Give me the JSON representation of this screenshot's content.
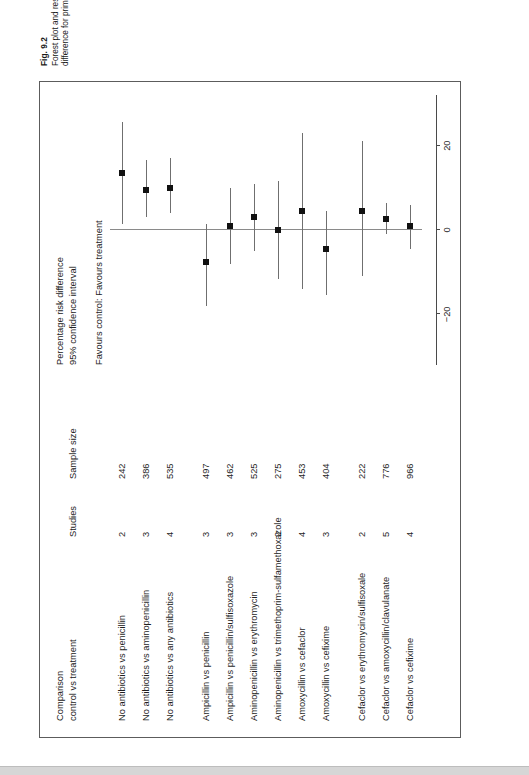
{
  "figure": {
    "number": "Fig. 9.2",
    "caption": "Forest plot and results from Rosenfeld's review for the main outcome of primary symptom control. Percentage risk difference for primary control of otitis media."
  },
  "headers": {
    "comparison": "Comparison\ncontrol vs treatment",
    "comparison_line1": "Comparison",
    "comparison_line2": "control vs treatment",
    "studies": "Studies",
    "sample_size": "Sample size",
    "axis_title_line1": "Percentage risk difference",
    "axis_title_line2": "95% confidence interval",
    "favours": "Favours control: Favours treatment"
  },
  "axis": {
    "ticks": [
      -20,
      0,
      20
    ],
    "tick_labels": [
      "−20",
      "0",
      "20"
    ],
    "min": -32,
    "max": 32
  },
  "chart_data": {
    "type": "forest",
    "title": "Percentage risk difference 95% confidence interval",
    "xlabel": "Percentage risk difference",
    "ylabel": "",
    "xlim": [
      -32,
      32
    ],
    "grid": false,
    "legend": "none",
    "zero_line": 0,
    "columns": [
      "Comparison control vs treatment",
      "Studies",
      "Sample size"
    ],
    "rows": [
      {
        "label": "No antibiotics vs penicillin",
        "studies": "2",
        "sample": "242",
        "estimate": 13.5,
        "lower": 1.5,
        "upper": 25.5,
        "group": 1
      },
      {
        "label": "No antibiotics vs aminopenicillin",
        "studies": "3",
        "sample": "386",
        "estimate": 9.5,
        "lower": 3.0,
        "upper": 16.5,
        "group": 1
      },
      {
        "label": "No antibiotics vs any antibiotics",
        "studies": "4",
        "sample": "535",
        "estimate": 10.0,
        "lower": 4.0,
        "upper": 17.0,
        "group": 1
      },
      {
        "label": "Ampicillin vs penicillin",
        "studies": "3",
        "sample": "497",
        "estimate": -7.5,
        "lower": -18.0,
        "upper": 1.5,
        "group": 2
      },
      {
        "label": "Ampicillin vs penicillin/sulfisoxazole",
        "studies": "3",
        "sample": "462",
        "estimate": 1.0,
        "lower": -8.0,
        "upper": 10.0,
        "group": 2
      },
      {
        "label": "Aminopenicillin vs erythromycin",
        "studies": "3",
        "sample": "525",
        "estimate": 3.0,
        "lower": -5.0,
        "upper": 11.0,
        "group": 2
      },
      {
        "label": "Aminopenicillin vs trimethoprim-sulfamethoxazole",
        "studies": "2",
        "sample": "275",
        "estimate": 0.0,
        "lower": -11.5,
        "upper": 11.5,
        "group": 2
      },
      {
        "label": "Amoxycillin vs cefaclor",
        "studies": "4",
        "sample": "453",
        "estimate": 4.5,
        "lower": -14.0,
        "upper": 23.0,
        "group": 2
      },
      {
        "label": "Amoxycillin vs cefixime",
        "studies": "3",
        "sample": "404",
        "estimate": -4.5,
        "lower": -15.5,
        "upper": 4.5,
        "group": 2
      },
      {
        "label": "Cefaclor vs erythromycin/sulfisoxale",
        "studies": "2",
        "sample": "222",
        "estimate": 4.5,
        "lower": -11.0,
        "upper": 21.0,
        "group": 3
      },
      {
        "label": "Cefaclor vs amoxycillin/clavulanate",
        "studies": "5",
        "sample": "776",
        "estimate": 2.5,
        "lower": -1.0,
        "upper": 6.5,
        "group": 3
      },
      {
        "label": "Cefaclor vs cefixime",
        "studies": "4",
        "sample": "966",
        "estimate": 1.0,
        "lower": -4.5,
        "upper": 6.0,
        "group": 3
      }
    ]
  },
  "colors": {
    "marker": "#111111",
    "ci_line": "#6f6f6f",
    "zero_line": "#8a8a8a",
    "box_border": "#5c5c5c",
    "text": "#1a1a1a"
  }
}
